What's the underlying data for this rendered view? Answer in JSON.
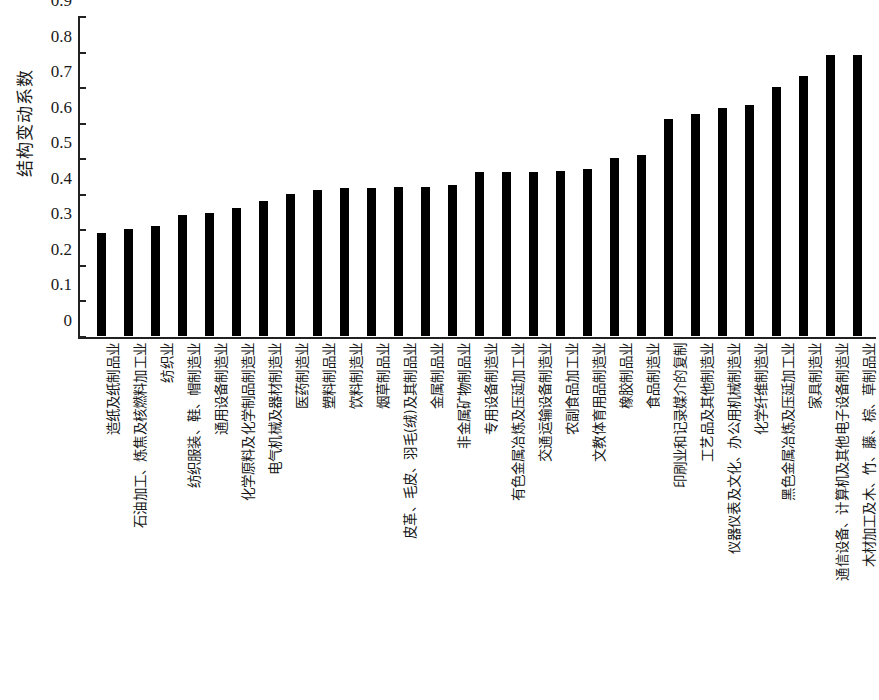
{
  "chart_data": {
    "type": "bar",
    "title": "",
    "subtitle": "",
    "xlabel": "",
    "ylabel": "结构变动系数",
    "ylim": [
      0,
      0.9
    ],
    "ytick_labels": [
      "0.9",
      "0.8",
      "0.7",
      "0.6",
      "0.5",
      "0.4",
      "0.3",
      "0.2",
      "0.1",
      "0"
    ],
    "ytick_values": [
      0.9,
      0.8,
      0.7,
      0.6,
      0.5,
      0.4,
      0.3,
      0.2,
      0.1,
      0
    ],
    "grid": false,
    "legend": null,
    "bar_color": "#000000",
    "orientation": "vertical",
    "sorted": "ascending",
    "categories": [
      "造纸及纸制品业",
      "石油加工、炼焦及核燃料加工业",
      "纺织业",
      "纺织服装、鞋、帽制造业",
      "通用设备制造业",
      "化学原料及化学制品制造业",
      "电气机械及器材制造业",
      "医药制造业",
      "塑料制品业",
      "饮料制造业",
      "烟草制品业",
      "皮革、毛皮、羽毛(绒)及其制品业",
      "金属制品业",
      "非金属矿物制品业",
      "专用设备制造业",
      "有色金属冶炼及压延加工业",
      "交通运输设备制造业",
      "农副食品加工业",
      "文教体育用品制造业",
      "橡胶制品业",
      "食品制造业",
      "印刷业和记录媒介的复制",
      "工艺品及其他制造业",
      "仪器仪表及文化、办公用机械制造业",
      "化学纤维制造业",
      "黑色金属冶炼及压延加工业",
      "家具制造业",
      "通信设备、计算机及其他电子设备制造业",
      "木材加工及木、竹、藤、棕、草制品业"
    ],
    "values": [
      0.29,
      0.3,
      0.31,
      0.34,
      0.345,
      0.36,
      0.38,
      0.4,
      0.41,
      0.415,
      0.415,
      0.42,
      0.42,
      0.425,
      0.46,
      0.46,
      0.46,
      0.465,
      0.47,
      0.5,
      0.51,
      0.61,
      0.625,
      0.64,
      0.65,
      0.7,
      0.73,
      0.79,
      0.79
    ]
  },
  "axes": {
    "y_title": "结构变动系数"
  }
}
